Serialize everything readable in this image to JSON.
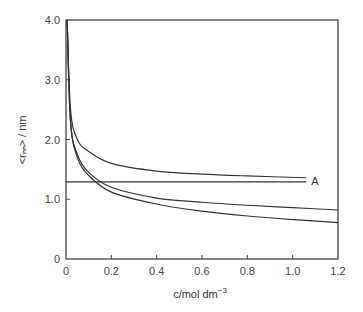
{
  "chart_data": {
    "type": "line",
    "title": "",
    "xlabel": "c/mol dm⁻³",
    "ylabel": "<rₙₙ> / nm",
    "xlim": [
      0,
      1.2
    ],
    "ylim": [
      0,
      4.0
    ],
    "x_ticks": [
      "0",
      "0.2",
      "0.4",
      "0.6",
      "0.8",
      "1.0",
      "1.2"
    ],
    "y_ticks": [
      "0",
      "1.0",
      "2.0",
      "3.0",
      "4.0"
    ],
    "grid": false,
    "legend": null,
    "annotations": [
      {
        "text": "A",
        "x": 1.1,
        "y": 1.29
      }
    ],
    "series": [
      {
        "name": "upper curve",
        "x": [
          0.005,
          0.02,
          0.05,
          0.1,
          0.2,
          0.4,
          0.6,
          0.8,
          1.06
        ],
        "y": [
          4.0,
          2.5,
          2.0,
          1.8,
          1.6,
          1.47,
          1.42,
          1.39,
          1.36
        ]
      },
      {
        "name": "middle curve",
        "x": [
          0.005,
          0.02,
          0.05,
          0.1,
          0.2,
          0.4,
          0.6,
          0.8,
          1.0,
          1.2
        ],
        "y": [
          4.0,
          2.3,
          1.75,
          1.45,
          1.2,
          1.02,
          0.95,
          0.9,
          0.86,
          0.82
        ]
      },
      {
        "name": "lower curve",
        "x": [
          0.005,
          0.02,
          0.05,
          0.1,
          0.2,
          0.4,
          0.6,
          0.8,
          1.0,
          1.2
        ],
        "y": [
          4.0,
          2.3,
          1.7,
          1.4,
          1.12,
          0.92,
          0.8,
          0.72,
          0.66,
          0.61
        ]
      },
      {
        "name": "A",
        "x": [
          0,
          1.06
        ],
        "y": [
          1.29,
          1.29
        ]
      }
    ]
  },
  "labels": {
    "x_axis": "c/mol dm",
    "x_axis_sup": "−3",
    "y_axis": "<rₙₙ> / nm",
    "annotation_a": "A"
  },
  "colors": {
    "line": "#333333",
    "frame": "#444444"
  }
}
